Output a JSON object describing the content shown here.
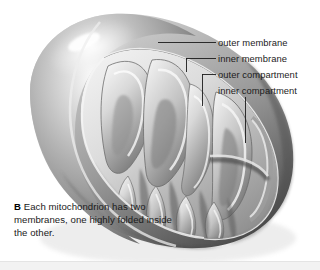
{
  "figure": {
    "background_color": "#ffffff",
    "line_color": "#1c1c1c"
  },
  "labels": [
    {
      "id": "outer-membrane",
      "text": "outer membrane"
    },
    {
      "id": "inner-membrane",
      "text": "inner membrane"
    },
    {
      "id": "outer-compartment",
      "text": "outer compartment"
    },
    {
      "id": "inner-compartment",
      "text": "inner compartment"
    }
  ],
  "caption": {
    "marker": "B",
    "text": " Each mitochondrion has two membranes, one highly folded inside the other."
  },
  "palette": {
    "body_light": "#f0f0f0",
    "body_mid": "#b9b9b9",
    "body_dark": "#6e6e6e",
    "body_shadow": "#3f3f3f",
    "highlight": "#ffffff",
    "crista_light": "#e6e6e6",
    "crista_dark": "#5a5a5a"
  }
}
